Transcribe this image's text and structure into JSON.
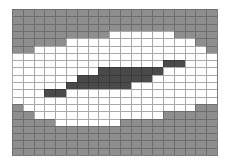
{
  "diagram": {
    "type": "pixel-grid",
    "columns": 19,
    "rows": 20,
    "legend": {
      "G": {
        "meaning": "background",
        "color": "#8e8e8e"
      },
      "W": {
        "meaning": "region",
        "color": "#ffffff"
      },
      "D": {
        "meaning": "core",
        "color": "#4a4a4a"
      }
    },
    "grid": [
      "GGGGGGGGGGGGGGGGGGG",
      "GGGGGGGGGGGGGGGGGGG",
      "GGGGGGGGGGGGGGGGGGG",
      "GGGGGGGGGWWWWWWGGGG",
      "GGGGGWWWWWWWWWWWWGG",
      "GGWWWWWWWWWWWWWWWWG",
      "WWWWWWWWWWWWWWWWWWW",
      "WWWWWWWWWWWWWWDDWWW",
      "WWWWWWWWDDDDDDWWWWW",
      "WWWWWWDDDDDDDWWWWWW",
      "WWWWWDDDDDDWWWWWWWW",
      "WWWDDWWWWWWWWWWWWWW",
      "WWWWWWWWWWWWWWWWWWW",
      "GWWWWWWWWWWWWWWWWGG",
      "GGWWWWWWWWWWWWGGGGG",
      "GGGGWWWWWWGGGGGGGGG",
      "GGGGGGGGGGGGGGGGGGG",
      "GGGGGGGGGGGGGGGGGGG",
      "GGGGGGGGGGGGGGGGGGG",
      "GGGGGGGGGGGGGGGGGGG"
    ]
  }
}
